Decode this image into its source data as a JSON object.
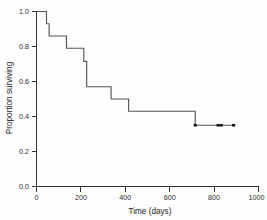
{
  "chart_data": {
    "type": "line",
    "subtype": "kaplan-meier-step",
    "title": "",
    "xlabel": "Time (days)",
    "ylabel": "Proportion surviving",
    "xlim": [
      0,
      1000
    ],
    "ylim": [
      0.0,
      1.0
    ],
    "xticks": [
      0,
      200,
      400,
      600,
      800,
      1000
    ],
    "xtick_labels": [
      "0",
      "200",
      "400",
      "600",
      "800",
      "1000"
    ],
    "yticks": [
      0.0,
      0.2,
      0.4,
      0.6,
      0.8,
      1.0
    ],
    "ytick_labels": [
      "0.0",
      "0.2",
      "0.4",
      "0.6",
      "0.8",
      "1.0"
    ],
    "grid": false,
    "legend": false,
    "series": [
      {
        "name": "survival",
        "x": [
          0,
          45,
          45,
          57,
          57,
          135,
          135,
          213,
          213,
          226,
          226,
          336,
          336,
          415,
          415,
          715,
          715,
          890
        ],
        "y": [
          1.0,
          1.0,
          0.93,
          0.93,
          0.86,
          0.86,
          0.79,
          0.79,
          0.715,
          0.715,
          0.57,
          0.57,
          0.5,
          0.5,
          0.43,
          0.43,
          0.35,
          0.35
        ],
        "steps": [
          {
            "time": 0,
            "survival": 1.0
          },
          {
            "time": 45,
            "survival": 0.93
          },
          {
            "time": 57,
            "survival": 0.86
          },
          {
            "time": 135,
            "survival": 0.79
          },
          {
            "time": 213,
            "survival": 0.715
          },
          {
            "time": 226,
            "survival": 0.57
          },
          {
            "time": 336,
            "survival": 0.5
          },
          {
            "time": 415,
            "survival": 0.43
          },
          {
            "time": 715,
            "survival": 0.35
          },
          {
            "time": 890,
            "survival": 0.35
          }
        ]
      }
    ],
    "censored": [
      {
        "time": 715,
        "survival": 0.35
      },
      {
        "time": 818,
        "survival": 0.35
      },
      {
        "time": 832,
        "survival": 0.35
      },
      {
        "time": 888,
        "survival": 0.35
      }
    ],
    "colors": {
      "line": "#555555",
      "axis": "#333333",
      "censor": "#111111",
      "background": "#fdfdfd"
    }
  }
}
